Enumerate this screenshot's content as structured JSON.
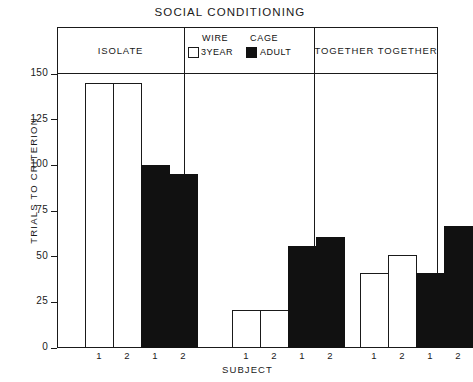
{
  "title": "SOCIAL  CONDITIONING",
  "axes": {
    "ylabel": "TRIALS  TO  CRITERION",
    "xlabel": "SUBJECT",
    "yticks": [
      "0",
      "25",
      "50",
      "75",
      "100",
      "125",
      "150"
    ]
  },
  "panels": [
    {
      "header": "ISOLATE"
    },
    {
      "header": ""
    },
    {
      "header": "TOGETHER TOGETHER"
    }
  ],
  "legend": {
    "heading_left": "WIRE",
    "heading_right": "CAGE",
    "entries": [
      {
        "label": "3YEAR",
        "swatch": "open-square-icon",
        "color": "#ffffff"
      },
      {
        "label": "ADULT",
        "swatch": "filled-square-icon",
        "color": "#111111"
      }
    ]
  },
  "xticklabels": [
    "1",
    "2",
    "1",
    "2",
    "1",
    "2",
    "1",
    "2",
    "1",
    "2",
    "1",
    "2"
  ],
  "chart_data": {
    "type": "bar",
    "title": "SOCIAL  CONDITIONING",
    "xlabel": "SUBJECT",
    "ylabel": "TRIALS  TO  CRITERION",
    "ylim": [
      0,
      150
    ],
    "yticks": [
      0,
      25,
      50,
      75,
      100,
      125,
      150
    ],
    "grid": false,
    "legend": {
      "position": "top-center-panel",
      "entries": [
        "3YEAR",
        "ADULT"
      ]
    },
    "groups": [
      "ISOLATE",
      "WIRE CAGE",
      "TOGETHER TOGETHER"
    ],
    "categories": [
      "1",
      "2",
      "1",
      "2",
      "1",
      "2",
      "1",
      "2",
      "1",
      "2",
      "1",
      "2"
    ],
    "series": [
      {
        "name": "3YEAR",
        "style": "open",
        "color": "#ffffff",
        "points": [
          {
            "group": "ISOLATE",
            "subject": "1",
            "value": 145
          },
          {
            "group": "ISOLATE",
            "subject": "2",
            "value": 145
          },
          {
            "group": "WIRE CAGE",
            "subject": "1",
            "value": 21
          },
          {
            "group": "WIRE CAGE",
            "subject": "2",
            "value": 21
          },
          {
            "group": "TOGETHER TOGETHER",
            "subject": "1",
            "value": 41
          },
          {
            "group": "TOGETHER TOGETHER",
            "subject": "2",
            "value": 51
          }
        ]
      },
      {
        "name": "ADULT",
        "style": "filled",
        "color": "#111111",
        "points": [
          {
            "group": "ISOLATE",
            "subject": "1",
            "value": 100
          },
          {
            "group": "ISOLATE",
            "subject": "2",
            "value": 95
          },
          {
            "group": "WIRE CAGE",
            "subject": "1",
            "value": 56
          },
          {
            "group": "WIRE CAGE",
            "subject": "2",
            "value": 61
          },
          {
            "group": "TOGETHER TOGETHER",
            "subject": "1",
            "value": 41
          },
          {
            "group": "TOGETHER TOGETHER",
            "subject": "2",
            "value": 67
          }
        ]
      }
    ],
    "bars": [
      {
        "group": "ISOLATE",
        "series": "3YEAR",
        "subject": "1",
        "value": 145
      },
      {
        "group": "ISOLATE",
        "series": "3YEAR",
        "subject": "2",
        "value": 145
      },
      {
        "group": "ISOLATE",
        "series": "ADULT",
        "subject": "1",
        "value": 100
      },
      {
        "group": "ISOLATE",
        "series": "ADULT",
        "subject": "2",
        "value": 95
      },
      {
        "group": "WIRE CAGE",
        "series": "3YEAR",
        "subject": "1",
        "value": 21
      },
      {
        "group": "WIRE CAGE",
        "series": "3YEAR",
        "subject": "2",
        "value": 21
      },
      {
        "group": "WIRE CAGE",
        "series": "ADULT",
        "subject": "1",
        "value": 56
      },
      {
        "group": "WIRE CAGE",
        "series": "ADULT",
        "subject": "2",
        "value": 61
      },
      {
        "group": "TOGETHER TOGETHER",
        "series": "3YEAR",
        "subject": "1",
        "value": 41
      },
      {
        "group": "TOGETHER TOGETHER",
        "series": "3YEAR",
        "subject": "2",
        "value": 51
      },
      {
        "group": "TOGETHER TOGETHER",
        "series": "ADULT",
        "subject": "1",
        "value": 41
      },
      {
        "group": "TOGETHER TOGETHER",
        "series": "ADULT",
        "subject": "2",
        "value": 67
      }
    ]
  }
}
